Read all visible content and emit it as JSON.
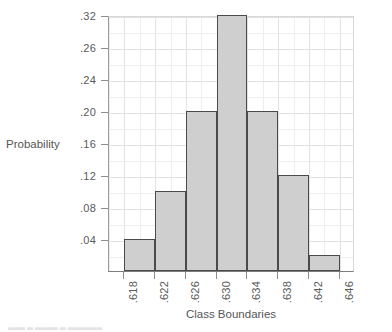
{
  "chart_data": {
    "type": "bar",
    "title": "",
    "subtitle": "",
    "xlabel": "Class Boundaries",
    "ylabel": "Probability",
    "grid": true,
    "legend": false,
    "legend_position": "none",
    "orientation": "vertical",
    "bar_style": "histogram-contiguous",
    "xlim": [
      0.616,
      0.648
    ],
    "ylim": [
      0.0,
      0.32
    ],
    "x_tick_labels": [
      ".618",
      ".622",
      ".626",
      ".630",
      ".634",
      ".638",
      ".642",
      ".646"
    ],
    "x_tick_values": [
      0.618,
      0.622,
      0.626,
      0.63,
      0.634,
      0.638,
      0.642,
      0.646
    ],
    "x_tick_rotation": "90",
    "y_tick_labels": [
      ".04",
      ".08",
      ".12",
      ".16",
      ".20",
      ".24",
      ".26",
      ".32"
    ],
    "y_tick_values": [
      0.04,
      0.08,
      0.12,
      0.16,
      0.2,
      0.24,
      0.28,
      0.32
    ],
    "bin_edges": [
      0.618,
      0.622,
      0.626,
      0.63,
      0.634,
      0.638,
      0.642,
      0.646
    ],
    "categories": [
      ".618-.622",
      ".622-.626",
      ".626-.630",
      ".630-.634",
      ".634-.638",
      ".638-.642",
      ".642-.646"
    ],
    "values": [
      0.04,
      0.1,
      0.2,
      0.32,
      0.2,
      0.12,
      0.02
    ],
    "bar_fill_color": "#cfcfcf",
    "bar_edge_color": "#4a4a4a",
    "grid_color": "#eceff1",
    "axis_color": "#8d8d8d"
  },
  "axes": {
    "y_title": "Probability",
    "x_title": "Class Boundaries"
  },
  "caption": {
    "remnant": "▄▄▄ ▄ ▄▄▄▄  ▄  ▄▄▄▄▄▄"
  }
}
